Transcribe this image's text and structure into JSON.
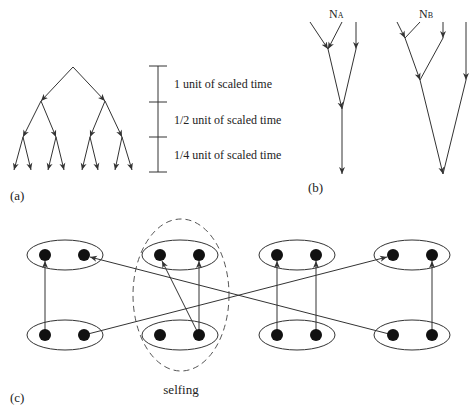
{
  "panels": {
    "a": {
      "label": "(a)",
      "scale_labels": [
        "1 unit of scaled time",
        "1/2 unit of scaled time",
        "1/4 unit of scaled time"
      ]
    },
    "b": {
      "label": "(b)",
      "node_a_main": "N",
      "node_a_sub": "A",
      "node_b_main": "N",
      "node_b_sub": "B"
    },
    "c": {
      "label": "(c)",
      "selfing_label": "selfing"
    }
  },
  "colors": {
    "line": "#333333",
    "dot": "#111111",
    "background": "#ffffff"
  }
}
